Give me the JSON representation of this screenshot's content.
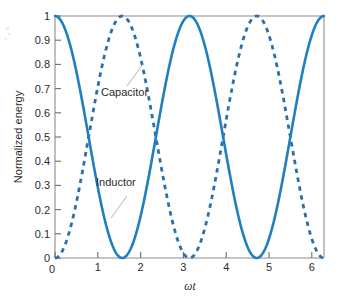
{
  "chart_data": {
    "type": "line",
    "title": "",
    "subtitle": "",
    "xlabel": "ωt",
    "ylabel": "Normalized energy",
    "xlim": [
      0,
      6.2832
    ],
    "ylim": [
      0,
      1
    ],
    "grid": false,
    "legend_position": "inline-annotations",
    "xticks": [
      0,
      1,
      2,
      3,
      4,
      5,
      6
    ],
    "xtick_labels": [
      "0",
      "1",
      "2",
      "3",
      "4",
      "5",
      "6"
    ],
    "yticks": [
      0,
      0.1,
      0.2,
      0.3,
      0.4,
      0.5,
      0.6,
      0.7,
      0.8,
      0.9,
      1
    ],
    "ytick_labels": [
      "0",
      "0.1",
      "0.2",
      "0.3",
      "0.4",
      "0.5",
      "0.6",
      "0.7",
      "0.8",
      "0.9",
      "1"
    ],
    "series": [
      {
        "name": "Inductor",
        "style": "solid",
        "color": "#1f7fc0",
        "formula": "cos^2(wt)",
        "x": [
          0,
          0.1571,
          0.3142,
          0.4712,
          0.6283,
          0.7854,
          0.9425,
          1.0996,
          1.2566,
          1.4137,
          1.5708,
          1.7279,
          1.885,
          2.042,
          2.1991,
          2.3562,
          2.5133,
          2.6704,
          2.8274,
          2.9845,
          3.1416,
          3.2987,
          3.4558,
          3.6128,
          3.7699,
          3.927,
          4.0841,
          4.2412,
          4.3982,
          4.5553,
          4.7124,
          4.8695,
          5.0265,
          5.1836,
          5.3407,
          5.4978,
          5.6549,
          5.8119,
          5.969,
          6.1261,
          6.2832
        ],
        "y": [
          1,
          0.9755,
          0.9045,
          0.7939,
          0.6545,
          0.5,
          0.3455,
          0.2061,
          0.0955,
          0.0245,
          0,
          0.0245,
          0.0955,
          0.2061,
          0.3455,
          0.5,
          0.6545,
          0.7939,
          0.9045,
          0.9755,
          1,
          0.9755,
          0.9045,
          0.7939,
          0.6545,
          0.5,
          0.3455,
          0.2061,
          0.0955,
          0.0245,
          0,
          0.0245,
          0.0955,
          0.2061,
          0.3455,
          0.5,
          0.6545,
          0.7939,
          0.9045,
          0.9755,
          1
        ]
      },
      {
        "name": "Capacitor",
        "style": "dashed",
        "color": "#2a6fae",
        "formula": "sin^2(wt)",
        "x": [
          0,
          0.1571,
          0.3142,
          0.4712,
          0.6283,
          0.7854,
          0.9425,
          1.0996,
          1.2566,
          1.4137,
          1.5708,
          1.7279,
          1.885,
          2.042,
          2.1991,
          2.3562,
          2.5133,
          2.6704,
          2.8274,
          2.9845,
          3.1416,
          3.2987,
          3.4558,
          3.6128,
          3.7699,
          3.927,
          4.0841,
          4.2412,
          4.3982,
          4.5553,
          4.7124,
          4.8695,
          5.0265,
          5.1836,
          5.3407,
          5.4978,
          5.6549,
          5.8119,
          5.969,
          6.1261,
          6.2832
        ],
        "y": [
          0,
          0.0245,
          0.0955,
          0.2061,
          0.3455,
          0.5,
          0.6545,
          0.7939,
          0.9045,
          0.9755,
          1,
          0.9755,
          0.9045,
          0.7939,
          0.6545,
          0.5,
          0.3455,
          0.2061,
          0.0955,
          0.0245,
          0,
          0.0245,
          0.0955,
          0.2061,
          0.3455,
          0.5,
          0.6545,
          0.7939,
          0.9045,
          0.9755,
          1,
          0.9755,
          0.9045,
          0.7939,
          0.6545,
          0.5,
          0.3455,
          0.2061,
          0.0955,
          0.0245,
          0
        ]
      }
    ],
    "annotations": [
      {
        "text": "Capacitor",
        "x": 1.15,
        "y": 0.72
      },
      {
        "text": "Inductor",
        "x": 1.05,
        "y": 0.33
      }
    ]
  },
  "colors": {
    "inductor": "#1f7fc0",
    "capacitor": "#2a6fae",
    "frame": "#8c8c8c",
    "text": "#2b2b2b",
    "leader": "#a8a8a8",
    "background": "#ffffff"
  },
  "labels": {
    "capacitor": "Capacitor",
    "inductor": "Inductor",
    "y_axis_title": "Normalized energy",
    "x_axis_title": "ωt",
    "y_1": "1",
    "y_09": "0.9",
    "y_08": "0.8",
    "y_07": "0.7",
    "y_06": "0.6",
    "y_05": "0.5",
    "y_04": "0.4",
    "y_03": "0.3",
    "y_02": "0.2",
    "y_01": "0.1",
    "y_0": "0",
    "x_0": "0",
    "x_1": "1",
    "x_2": "2",
    "x_3": "3",
    "x_4": "4",
    "x_5": "5",
    "x_6": "6"
  }
}
